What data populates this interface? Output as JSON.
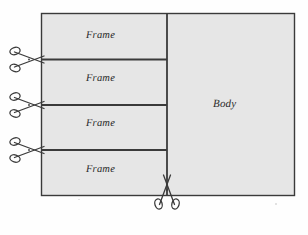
{
  "figure": {
    "paper_color": "#fefefe",
    "panel_fill": "#e6e6e6",
    "stroke_color": "#3a3a3a",
    "text_color": "#2b2b2b"
  },
  "panels": {
    "frames": [
      {
        "label": "Frame"
      },
      {
        "label": "Frame"
      },
      {
        "label": "Frame"
      },
      {
        "label": "Frame"
      }
    ],
    "body": {
      "label": "Body"
    }
  },
  "cut_marks": [
    {
      "name": "scissors-frame-cut-1",
      "orientation": "horizontal",
      "icon": "scissors-icon"
    },
    {
      "name": "scissors-frame-cut-2",
      "orientation": "horizontal",
      "icon": "scissors-icon"
    },
    {
      "name": "scissors-frame-cut-3",
      "orientation": "horizontal",
      "icon": "scissors-icon"
    },
    {
      "name": "scissors-body-cut",
      "orientation": "vertical",
      "icon": "scissors-icon"
    }
  ]
}
